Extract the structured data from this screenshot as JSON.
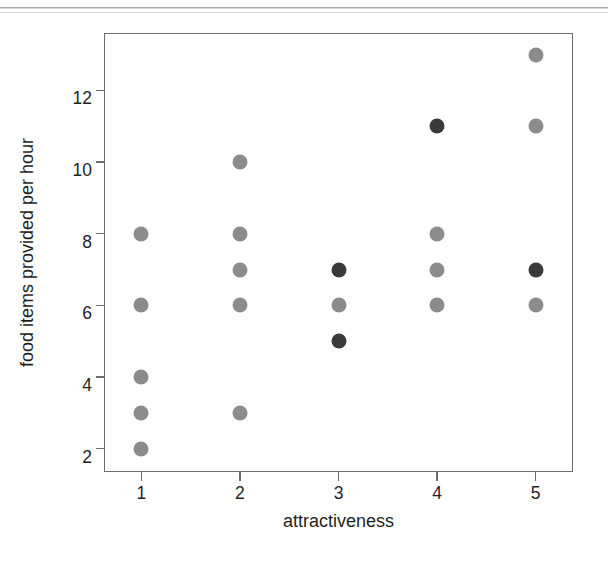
{
  "chart_data": {
    "type": "scatter",
    "title": "",
    "xlabel": "attractiveness",
    "ylabel": "food items provided per hour",
    "xlim": [
      0.62,
      5.38
    ],
    "ylim": [
      1.35,
      13.6
    ],
    "xticks": [
      1,
      2,
      3,
      4,
      5
    ],
    "yticks": [
      2,
      4,
      6,
      8,
      10,
      12
    ],
    "xtick_labels": [
      "1",
      "2",
      "3",
      "4",
      "5"
    ],
    "ytick_labels": [
      "2",
      "4",
      "6",
      "8",
      "10",
      "12"
    ],
    "grid": false,
    "legend": "none",
    "marker_colors": {
      "light": "#8c8c8c",
      "dark": "#3a3a3a"
    },
    "frame_color": "#6d6d6d",
    "background": "#ffffff",
    "series": [
      {
        "name": "light-gray points",
        "color": "#8c8c8c",
        "points": [
          {
            "x": 1,
            "y": 8
          },
          {
            "x": 1,
            "y": 6
          },
          {
            "x": 1,
            "y": 4
          },
          {
            "x": 1,
            "y": 3
          },
          {
            "x": 1,
            "y": 2
          },
          {
            "x": 2,
            "y": 10
          },
          {
            "x": 2,
            "y": 8
          },
          {
            "x": 2,
            "y": 7
          },
          {
            "x": 2,
            "y": 6
          },
          {
            "x": 2,
            "y": 3
          },
          {
            "x": 3,
            "y": 6
          },
          {
            "x": 4,
            "y": 8
          },
          {
            "x": 4,
            "y": 7
          },
          {
            "x": 4,
            "y": 6
          },
          {
            "x": 5,
            "y": 13
          },
          {
            "x": 5,
            "y": 11
          },
          {
            "x": 5,
            "y": 6
          }
        ]
      },
      {
        "name": "dark points",
        "color": "#3a3a3a",
        "points": [
          {
            "x": 3,
            "y": 7
          },
          {
            "x": 3,
            "y": 5
          },
          {
            "x": 4,
            "y": 11
          },
          {
            "x": 5,
            "y": 7
          }
        ]
      }
    ]
  }
}
